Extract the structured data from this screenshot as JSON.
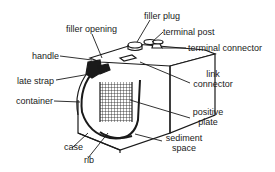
{
  "diagram": {
    "labels": {
      "filler_opening": "filler opening",
      "filler_plug": "filler plug",
      "terminal_post": "terminal post",
      "terminal_connector": "terminal connector",
      "handle": "handle",
      "plate_strap": "late strap",
      "link_connector_line1": "link",
      "link_connector_line2": "connector",
      "container": "container",
      "positive_plate_line1": "positive",
      "positive_plate_line2": "plate",
      "case": "case",
      "rib": "rib",
      "sediment_space_line1": "sediment",
      "sediment_space_line2": "space"
    },
    "colors": {
      "ink": "#1a1a1a",
      "background": "#ffffff"
    }
  }
}
